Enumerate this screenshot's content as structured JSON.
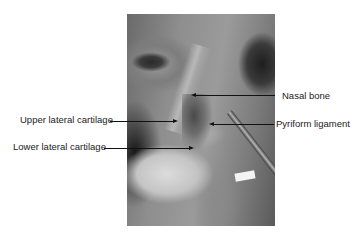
{
  "figure": {
    "labels": {
      "nasal_bone": "Nasal bone",
      "pyriform_ligament": "Pyriform ligament",
      "upper_lateral_cartilage": "Upper lateral cartilage",
      "lower_lateral_cartilage": "Lower lateral cartilage"
    }
  }
}
